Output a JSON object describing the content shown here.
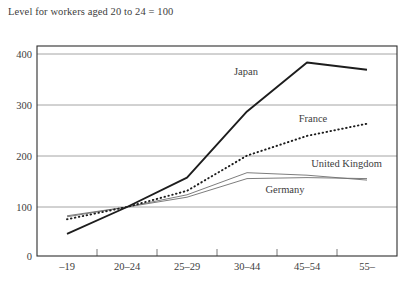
{
  "subtitle": "Level for workers aged 20 to 24 = 100",
  "axis": {
    "y_ticks": [
      "0",
      "100",
      "200",
      "300",
      "400"
    ],
    "x_ticks": [
      "–19",
      "20–24",
      "25–29",
      "30–44",
      "45–54",
      "55–"
    ]
  },
  "series_labels": {
    "japan": "Japan",
    "france": "France",
    "united_kingdom": "United Kingdom",
    "germany": "Germany"
  },
  "colors": {
    "japan": "#1d1d1d",
    "france": "#1d1d1d",
    "united_kingdom": "#6e6e6e",
    "germany": "#6e6e6e",
    "frame": "#2e2e2e",
    "grid": "#9a9a9a",
    "text": "#3d3d3d",
    "background": "#ffffff"
  },
  "chart_data": {
    "type": "line",
    "title": "",
    "subtitle": "Level for workers aged 20 to 24 = 100",
    "xlabel": "",
    "ylabel": "",
    "categories": [
      "–19",
      "20–24",
      "25–29",
      "30–44",
      "45–54",
      "55–"
    ],
    "ylim": [
      0,
      420
    ],
    "yticks": [
      0,
      100,
      200,
      300,
      400
    ],
    "grid": true,
    "legend": "inline-labels",
    "series": [
      {
        "name": "Japan",
        "style": "solid-thick",
        "color": "#1d1d1d",
        "values": [
          45,
          100,
          160,
          295,
          395,
          380
        ]
      },
      {
        "name": "France",
        "style": "dotted",
        "color": "#1d1d1d",
        "values": [
          75,
          100,
          133,
          205,
          245,
          270
        ]
      },
      {
        "name": "United Kingdom",
        "style": "solid-thin",
        "color": "#6e6e6e",
        "values": [
          82,
          100,
          125,
          170,
          165,
          155
        ]
      },
      {
        "name": "Germany",
        "style": "solid-thin",
        "color": "#6e6e6e",
        "values": [
          80,
          100,
          120,
          158,
          160,
          158
        ]
      }
    ]
  }
}
